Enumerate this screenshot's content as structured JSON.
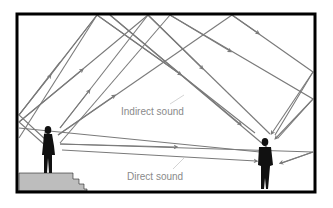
{
  "diagram": {
    "labels": {
      "indirect": "Indirect sound",
      "direct": "Direct sound"
    },
    "elements": {
      "room": "room-outline",
      "speaker": "speaker-figure",
      "listener": "listener-figure",
      "stage": "stairs-platform"
    },
    "colors": {
      "frame": "#000000",
      "ray": "#7a7a7a",
      "stairs": "#bdbdbd",
      "label": "#8a8a8a",
      "leader": "#c8c8c8"
    }
  }
}
